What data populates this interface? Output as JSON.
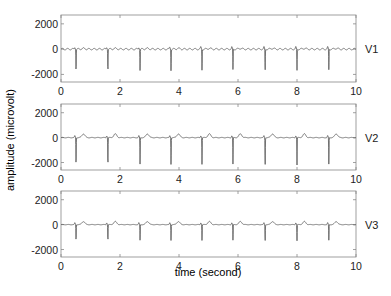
{
  "chart_data": {
    "type": "line",
    "title": "",
    "xlabel": "time (second)",
    "ylabel": "amplitude (microvolt)",
    "xlim": [
      0,
      10
    ],
    "xticks": [
      0,
      2,
      4,
      6,
      8,
      10
    ],
    "yticks": [
      -2000,
      0,
      2000
    ],
    "grid": false,
    "legend_position": "right-of-each-panel",
    "beat_times_s": [
      0.51,
      1.59,
      2.68,
      3.73,
      4.78,
      5.83,
      6.92,
      8.0,
      9.08
    ],
    "panels": [
      {
        "name": "V1",
        "label": "V1",
        "ylim": [
          -2600,
          2700
        ],
        "baseline": 0,
        "r_spike_uV": -1700,
        "t_wave_uV": 60,
        "ripple_uV": 120,
        "ripple_period_s": 0.18
      },
      {
        "name": "V2",
        "label": "V2",
        "ylim": [
          -2600,
          2700
        ],
        "baseline": 0,
        "r_spike_uV": -2200,
        "t_wave_uV": 300,
        "ripple_uV": 40,
        "ripple_period_s": 0.2
      },
      {
        "name": "V3",
        "label": "V3",
        "ylim": [
          -2600,
          2700
        ],
        "baseline": 0,
        "r_spike_uV": -1300,
        "t_wave_uV": 250,
        "ripple_uV": 30,
        "ripple_period_s": 0.2
      }
    ]
  },
  "colors": {
    "trace": "#555555",
    "axes": "#888888",
    "text": "#222222"
  }
}
